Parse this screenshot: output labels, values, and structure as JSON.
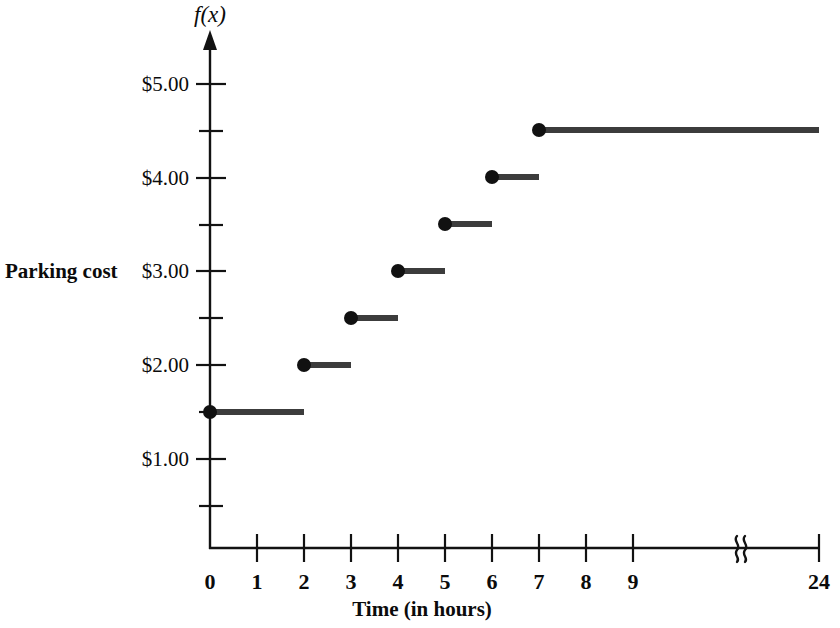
{
  "chart_data": {
    "type": "line",
    "title": "",
    "subtitle": "",
    "xlabel": "Time (in hours)",
    "ylabel": "Parking cost",
    "y_axis_symbol": "f(x)",
    "xlim": [
      0,
      24
    ],
    "ylim": [
      0,
      5.25
    ],
    "grid": false,
    "legend": null,
    "annotations": [
      "axis-break between 9 and 24 on x-axis"
    ],
    "x_tick_labels": [
      "0",
      "1",
      "2",
      "3",
      "4",
      "5",
      "6",
      "7",
      "8",
      "9",
      "24"
    ],
    "x_tick_values": [
      0,
      1,
      2,
      3,
      4,
      5,
      6,
      7,
      8,
      9,
      24
    ],
    "y_tick_labels": [
      "$1.00",
      "$2.00",
      "$3.00",
      "$4.00",
      "$5.00"
    ],
    "y_tick_values": [
      1.0,
      2.0,
      3.0,
      4.0,
      5.0
    ],
    "y_minor_tick_values": [
      0.5,
      1.5,
      2.5,
      3.5,
      4.5
    ],
    "series_name": "Parking cost step function",
    "steps": [
      {
        "x_start": 0,
        "x_end": 2,
        "y": 1.5,
        "closed_left": true,
        "label": "$1.50"
      },
      {
        "x_start": 2,
        "x_end": 3,
        "y": 2.0,
        "closed_left": true,
        "label": "$2.00"
      },
      {
        "x_start": 3,
        "x_end": 4,
        "y": 2.5,
        "closed_left": true,
        "label": "$2.50"
      },
      {
        "x_start": 4,
        "x_end": 5,
        "y": 3.0,
        "closed_left": true,
        "label": "$3.00"
      },
      {
        "x_start": 5,
        "x_end": 6,
        "y": 3.5,
        "closed_left": true,
        "label": "$3.50"
      },
      {
        "x_start": 6,
        "x_end": 7,
        "y": 4.0,
        "closed_left": true,
        "label": "$4.00"
      },
      {
        "x_start": 7,
        "x_end": 24,
        "y": 4.5,
        "closed_left": true,
        "label": "$4.50"
      }
    ],
    "colors": {
      "axis": "#121212",
      "step_line": "#3c3c3c",
      "dot": "#111111",
      "background": "#ffffff"
    }
  },
  "labels": {
    "y_axis_function": "f(x)",
    "y_axis_title": "Parking cost",
    "x_axis_title": "Time (in hours)",
    "y0": "$1.00",
    "y1": "$2.00",
    "y2": "$3.00",
    "y3": "$4.00",
    "y4": "$5.00",
    "x0": "0",
    "x1": "1",
    "x2": "2",
    "x3": "3",
    "x4": "4",
    "x5": "5",
    "x6": "6",
    "x7": "7",
    "x8": "8",
    "x9": "9",
    "x24": "24"
  }
}
